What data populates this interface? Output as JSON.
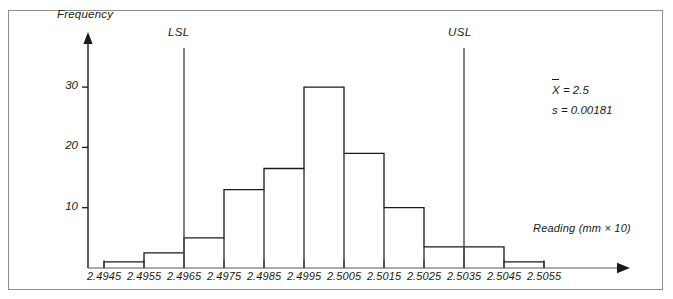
{
  "chart_data": {
    "type": "bar",
    "title": "",
    "xlabel": "Reading (mm × 10)",
    "ylabel": "Frequency",
    "ylim": [
      0,
      34
    ],
    "yticks": [
      10,
      20,
      30
    ],
    "ytick_labels": [
      "10",
      "20",
      "30"
    ],
    "grid": false,
    "legend": null,
    "bin_edges": [
      "2.4945",
      "2.4955",
      "2.4965",
      "2.4975",
      "2.4985",
      "2.4995",
      "2.5005",
      "2.5015",
      "2.5025",
      "2.5035",
      "2.5045",
      "2.5055"
    ],
    "categories": [
      "2.4945-2.4955",
      "2.4955-2.4965",
      "2.4965-2.4975",
      "2.4975-2.4985",
      "2.4985-2.4995",
      "2.4995-2.5005",
      "2.5005-2.5015",
      "2.5015-2.5025",
      "2.5025-2.5035",
      "2.5035-2.5045",
      "2.5045-2.5055"
    ],
    "values": [
      1,
      2.5,
      5,
      13,
      16.5,
      30,
      19,
      10,
      3.5,
      3.5,
      1
    ],
    "annotations": [
      {
        "name": "LSL",
        "label": "LSL",
        "x": "2.4965"
      },
      {
        "name": "USL",
        "label": "USL",
        "x": "2.5035"
      }
    ],
    "statistics": [
      {
        "symbol": "X",
        "overbar": true,
        "text": "= 2.5"
      },
      {
        "symbol": "s",
        "overbar": false,
        "text": "= 0.00181"
      }
    ]
  },
  "axes": {
    "y_title": "Frequency",
    "x_title": "Reading (mm × 10)",
    "y_ticks": [
      "10",
      "20",
      "30"
    ],
    "x_ticks": [
      "2.4945",
      "2.4955",
      "2.4965",
      "2.4975",
      "2.4985",
      "2.4995",
      "2.5005",
      "2.5015",
      "2.5025",
      "2.5035",
      "2.5045",
      "2.5055"
    ]
  },
  "limits": {
    "lsl_label": "LSL",
    "usl_label": "USL"
  },
  "stats": {
    "mean_symbol": "X",
    "mean_text": "= 2.5",
    "sd_symbol": "s",
    "sd_text": "= 0.00181"
  },
  "colors": {
    "line": "#1a1a1a",
    "frame": "#8d8d8d",
    "background": "#ffffff"
  }
}
